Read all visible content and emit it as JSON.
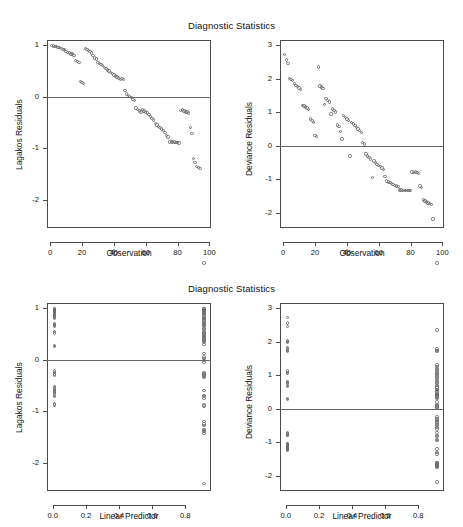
{
  "figure": {
    "width": 463,
    "height": 527,
    "background": "#ffffff",
    "point_color": "#6b6b6b",
    "axis_color": "#4c4c4c",
    "zeroline_color": "#666666"
  },
  "panels": [
    {
      "id": "top-left",
      "title": "Diagnostic Statistics",
      "xlabel": "Observation",
      "ylabel": "Lagakos Residuals"
    },
    {
      "id": "top-right",
      "title": "Diagnostic Statistics",
      "xlabel": "Observation",
      "ylabel": "Deviance Residuals"
    },
    {
      "id": "bottom-left",
      "title": "Diagnostic Statistics",
      "xlabel": "Linear Predictor",
      "ylabel": "Lagakos Residuals"
    },
    {
      "id": "bottom-right",
      "title": "Diagnostic Statistics",
      "xlabel": "Linear Predictor",
      "ylabel": "Deviance Residuals"
    }
  ],
  "chart_data": [
    {
      "type": "scatter",
      "id": "top-left",
      "title": "Diagnostic Statistics",
      "xlabel": "Observation",
      "ylabel": "Lagakos Residuals",
      "xticks": [
        0,
        20,
        40,
        60,
        80,
        100
      ],
      "xticklabels": [
        "0",
        "20",
        "40",
        "60",
        "80",
        "100"
      ],
      "yticks": [
        -2,
        -1,
        0,
        1
      ],
      "yticklabels": [
        "-2",
        "-1",
        "0",
        "1"
      ],
      "xlim": [
        -2,
        101
      ],
      "ylim": [
        -2.55,
        1.1
      ],
      "grid": false,
      "legend": null,
      "zero_reference_line": 0,
      "marker": "open-circle",
      "x": [
        1,
        2,
        3,
        4,
        5,
        6,
        7,
        8,
        9,
        10,
        11,
        12,
        13,
        14,
        15,
        16,
        17,
        18,
        19,
        20,
        21,
        22,
        23,
        24,
        25,
        26,
        27,
        28,
        29,
        30,
        31,
        32,
        33,
        34,
        35,
        36,
        37,
        38,
        39,
        40,
        41,
        42,
        43,
        44,
        45,
        46,
        47,
        48,
        49,
        50,
        51,
        52,
        53,
        54,
        55,
        56,
        57,
        58,
        59,
        60,
        61,
        62,
        63,
        64,
        65,
        66,
        67,
        68,
        69,
        70,
        71,
        72,
        73,
        74,
        75,
        76,
        77,
        78,
        79,
        80,
        81,
        82,
        83,
        84,
        85,
        86,
        87,
        88,
        89,
        90,
        91,
        92,
        93,
        94
      ],
      "y": [
        0.99,
        0.98,
        0.97,
        0.97,
        0.96,
        0.95,
        0.94,
        0.92,
        0.91,
        0.88,
        0.86,
        0.85,
        0.83,
        0.83,
        0.8,
        0.7,
        0.68,
        0.66,
        0.3,
        0.28,
        0.26,
        0.93,
        0.92,
        0.9,
        0.88,
        0.85,
        0.8,
        0.75,
        0.73,
        0.66,
        0.64,
        0.62,
        0.6,
        0.57,
        0.55,
        0.52,
        0.5,
        0.47,
        0.45,
        0.42,
        0.4,
        0.38,
        0.36,
        0.33,
        0.35,
        0.33,
        0.12,
        0.05,
        0.02,
        0.0,
        -0.02,
        -0.05,
        -0.08,
        -0.22,
        -0.25,
        -0.28,
        -0.3,
        -0.26,
        -0.28,
        -0.3,
        -0.32,
        -0.35,
        -0.38,
        -0.42,
        -0.45,
        -0.52,
        -0.55,
        -0.58,
        -0.6,
        -0.63,
        -0.66,
        -0.7,
        -0.75,
        -0.78,
        -0.88,
        -0.88,
        -0.88,
        -0.88,
        -0.89,
        -0.89,
        -0.9,
        -0.27,
        -0.26,
        -0.28,
        -0.3,
        -0.3,
        -0.32,
        -0.6,
        -0.72,
        -1.2,
        -1.28,
        -1.35,
        -1.38,
        -1.4,
        -1.43,
        -2.4
      ]
    },
    {
      "type": "scatter",
      "id": "top-right",
      "title": "Diagnostic Statistics",
      "xlabel": "Observation",
      "ylabel": "Deviance Residuals",
      "xticks": [
        0,
        20,
        40,
        60,
        80,
        100
      ],
      "xticklabels": [
        "0",
        "20",
        "40",
        "60",
        "80",
        "100"
      ],
      "yticks": [
        -2,
        -1,
        0,
        1,
        2,
        3
      ],
      "yticklabels": [
        "-2",
        "-1",
        "0",
        "1",
        "2",
        "3"
      ],
      "xlim": [
        -2,
        101
      ],
      "ylim": [
        -2.45,
        3.15
      ],
      "grid": false,
      "legend": null,
      "zero_reference_line": 0,
      "marker": "open-circle",
      "x": [
        1,
        2,
        3,
        4,
        5,
        6,
        7,
        8,
        9,
        10,
        11,
        12,
        13,
        14,
        15,
        16,
        17,
        18,
        19,
        20,
        21,
        22,
        23,
        24,
        25,
        26,
        27,
        28,
        29,
        30,
        31,
        32,
        33,
        34,
        35,
        36,
        37,
        38,
        39,
        40,
        41,
        42,
        43,
        44,
        45,
        46,
        47,
        48,
        49,
        50,
        51,
        52,
        53,
        54,
        55,
        56,
        57,
        58,
        59,
        60,
        61,
        62,
        63,
        64,
        65,
        66,
        67,
        68,
        69,
        70,
        71,
        72,
        73,
        74,
        75,
        76,
        77,
        78,
        79,
        80,
        81,
        82,
        83,
        84,
        85,
        86,
        87,
        88,
        89,
        90,
        91,
        92,
        93,
        94
      ],
      "y": [
        2.72,
        2.55,
        2.45,
        2.0,
        1.98,
        1.95,
        1.85,
        1.8,
        1.76,
        1.72,
        1.68,
        1.2,
        1.18,
        1.15,
        1.12,
        1.08,
        0.8,
        0.75,
        0.7,
        0.3,
        0.28,
        2.35,
        1.78,
        1.75,
        1.7,
        1.22,
        1.4,
        1.35,
        1.3,
        0.95,
        1.1,
        1.05,
        1.0,
        0.62,
        0.58,
        0.42,
        0.2,
        0.9,
        0.85,
        0.8,
        0.75,
        -0.3,
        0.7,
        0.65,
        0.6,
        0.55,
        0.5,
        0.45,
        0.4,
        0.1,
        0.05,
        -0.25,
        -0.3,
        -0.35,
        -0.4,
        -0.95,
        -0.45,
        -0.5,
        -0.55,
        -0.58,
        -0.62,
        -0.66,
        -0.7,
        -0.92,
        -1.05,
        -1.08,
        -1.1,
        -1.12,
        -1.15,
        -1.18,
        -1.2,
        -1.22,
        -1.32,
        -1.32,
        -1.33,
        -1.33,
        -1.33,
        -1.34,
        -1.34,
        -1.34,
        -0.78,
        -0.8,
        -0.78,
        -0.8,
        -0.82,
        -1.2,
        -1.25,
        -1.62,
        -1.65,
        -1.68,
        -1.7,
        -1.72,
        -1.75,
        -2.18
      ]
    },
    {
      "type": "scatter",
      "id": "bottom-left",
      "title": "Diagnostic Statistics",
      "xlabel": "Linear Predictor",
      "ylabel": "Lagakos Residuals",
      "xticks": [
        0.0,
        0.2,
        0.4,
        0.6,
        0.8
      ],
      "xticklabels": [
        "0.0",
        "0.2",
        "0.4",
        "0.6",
        "0.8"
      ],
      "yticks": [
        -2,
        -1,
        0,
        1
      ],
      "yticklabels": [
        "-2",
        "-1",
        "0",
        "1"
      ],
      "xlim": [
        -0.035,
        0.955
      ],
      "ylim": [
        -2.55,
        1.1
      ],
      "grid": false,
      "legend": null,
      "zero_reference_line": 0,
      "marker": "open-circle",
      "x": [
        0.012,
        0.012,
        0.012,
        0.012,
        0.012,
        0.012,
        0.012,
        0.012,
        0.012,
        0.012,
        0.012,
        0.012,
        0.012,
        0.012,
        0.012,
        0.012,
        0.012,
        0.012,
        0.012,
        0.012,
        0.012,
        0.012,
        0.012,
        0.012,
        0.012,
        0.012,
        0.012,
        0.012,
        0.012,
        0.012,
        0.012,
        0.012,
        0.012,
        0.012,
        0.012,
        0.012,
        0.012,
        0.912,
        0.912,
        0.912,
        0.912,
        0.912,
        0.912,
        0.912,
        0.912,
        0.912,
        0.912,
        0.912,
        0.912,
        0.912,
        0.912,
        0.912,
        0.912,
        0.912,
        0.912,
        0.912,
        0.912,
        0.912,
        0.912,
        0.912,
        0.912,
        0.912,
        0.912,
        0.912,
        0.912,
        0.912,
        0.912,
        0.912,
        0.912,
        0.912,
        0.912,
        0.912,
        0.912,
        0.912,
        0.912,
        0.912,
        0.912,
        0.912,
        0.912,
        0.912,
        0.912,
        0.912,
        0.912,
        0.912,
        0.912,
        0.912,
        0.912,
        0.912,
        0.912,
        0.912,
        0.912,
        0.912,
        0.912,
        0.912
      ],
      "y": [
        0.99,
        0.98,
        0.97,
        0.96,
        0.95,
        0.94,
        0.93,
        0.92,
        0.9,
        0.88,
        0.86,
        0.85,
        0.83,
        0.8,
        0.7,
        0.68,
        0.66,
        0.64,
        0.55,
        0.52,
        0.28,
        0.26,
        -0.22,
        -0.25,
        -0.28,
        -0.3,
        -0.52,
        -0.55,
        -0.58,
        -0.6,
        -0.62,
        -0.64,
        -0.66,
        -0.7,
        -0.72,
        -0.86,
        -0.88,
        0.99,
        0.98,
        0.97,
        0.96,
        0.95,
        0.93,
        0.92,
        0.9,
        0.88,
        0.85,
        0.82,
        0.8,
        0.78,
        0.75,
        0.72,
        0.7,
        0.68,
        0.66,
        0.64,
        0.6,
        0.58,
        0.55,
        0.52,
        0.5,
        0.48,
        0.45,
        0.42,
        0.4,
        0.38,
        0.35,
        0.33,
        0.3,
        0.12,
        0.05,
        0.02,
        -0.02,
        -0.05,
        -0.26,
        -0.28,
        -0.3,
        -0.32,
        -0.35,
        -0.6,
        -0.7,
        -0.72,
        -0.75,
        -1.2,
        -1.25,
        -1.28,
        -1.35,
        -1.38,
        -1.4,
        -1.43,
        -2.4,
        -0.88,
        -0.9
      ]
    },
    {
      "type": "scatter",
      "id": "bottom-right",
      "title": "Diagnostic Statistics",
      "xlabel": "Linear Predictor",
      "ylabel": "Deviance Residuals",
      "xticks": [
        0.0,
        0.2,
        0.4,
        0.6,
        0.8
      ],
      "xticklabels": [
        "0.0",
        "0.2",
        "0.4",
        "0.6",
        "0.8"
      ],
      "yticks": [
        -2,
        -1,
        0,
        1,
        2,
        3
      ],
      "yticklabels": [
        "-2",
        "-1",
        "0",
        "1",
        "2",
        "3"
      ],
      "xlim": [
        -0.035,
        0.955
      ],
      "ylim": [
        -2.45,
        3.15
      ],
      "grid": false,
      "legend": null,
      "zero_reference_line": 0,
      "marker": "open-circle",
      "x": [
        0.012,
        0.012,
        0.012,
        0.012,
        0.012,
        0.012,
        0.012,
        0.012,
        0.012,
        0.012,
        0.012,
        0.012,
        0.012,
        0.012,
        0.012,
        0.012,
        0.012,
        0.012,
        0.012,
        0.012,
        0.012,
        0.012,
        0.012,
        0.012,
        0.012,
        0.012,
        0.012,
        0.012,
        0.012,
        0.012,
        0.012,
        0.012,
        0.012,
        0.012,
        0.012,
        0.012,
        0.912,
        0.912,
        0.912,
        0.912,
        0.912,
        0.912,
        0.912,
        0.912,
        0.912,
        0.912,
        0.912,
        0.912,
        0.912,
        0.912,
        0.912,
        0.912,
        0.912,
        0.912,
        0.912,
        0.912,
        0.912,
        0.912,
        0.912,
        0.912,
        0.912,
        0.912,
        0.912,
        0.912,
        0.912,
        0.912,
        0.912,
        0.912,
        0.912,
        0.912,
        0.912,
        0.912,
        0.912,
        0.912,
        0.912,
        0.912,
        0.912,
        0.912,
        0.912,
        0.912,
        0.912,
        0.912,
        0.912,
        0.912,
        0.912,
        0.912,
        0.912,
        0.912,
        0.912,
        0.912,
        0.912,
        0.912,
        0.912,
        0.912
      ],
      "y": [
        2.72,
        2.55,
        2.45,
        2.02,
        2.0,
        1.98,
        1.82,
        1.78,
        1.74,
        1.7,
        1.12,
        1.08,
        1.05,
        0.82,
        0.78,
        0.75,
        0.7,
        0.66,
        0.3,
        0.28,
        -0.72,
        -0.75,
        -0.78,
        -0.8,
        -1.05,
        -1.08,
        -1.1,
        -1.12,
        -1.15,
        -1.18,
        -1.2,
        -1.22,
        -1.25,
        -1.05,
        -1.08,
        -1.1,
        2.35,
        1.78,
        1.74,
        1.7,
        1.3,
        1.25,
        1.2,
        1.15,
        1.1,
        1.05,
        1.0,
        0.95,
        0.9,
        0.85,
        0.8,
        0.75,
        0.7,
        0.65,
        0.62,
        0.58,
        0.55,
        0.5,
        0.45,
        0.42,
        0.4,
        0.38,
        0.35,
        0.3,
        0.2,
        0.12,
        0.08,
        0.05,
        0.02,
        -0.25,
        -0.3,
        -0.35,
        -0.4,
        -0.45,
        -0.5,
        -0.55,
        -0.6,
        -0.7,
        -0.92,
        -0.95,
        -1.2,
        -1.3,
        -1.6,
        -1.62,
        -1.65,
        -1.68,
        -1.7,
        -1.72,
        -1.75,
        -2.18,
        -0.8,
        -0.82,
        -1.35
      ]
    }
  ]
}
